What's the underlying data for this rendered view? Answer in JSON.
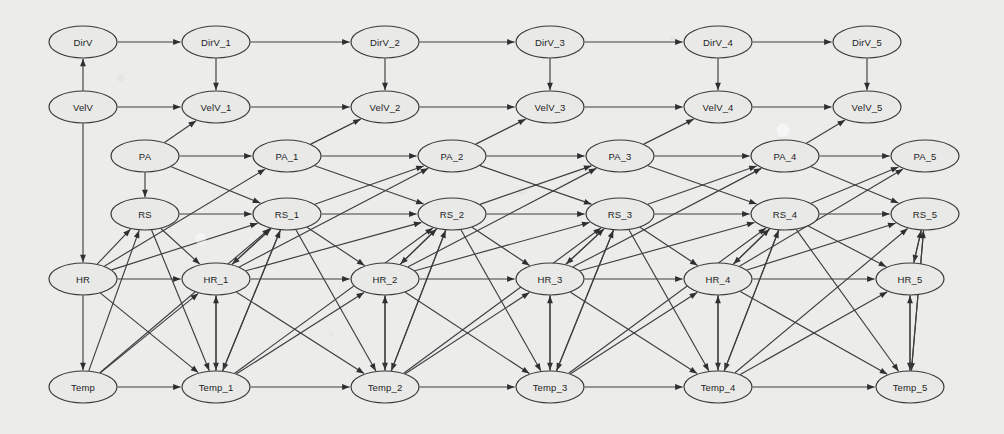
{
  "figure": {
    "kind": "dynamic-bayesian-network",
    "title": "",
    "background_color": "#ececeb",
    "node_fill": "#e9e9e8",
    "node_stroke": "#3a3a3a",
    "edge_color": "#3e3e3e",
    "node_width": 68,
    "node_height": 32
  },
  "variables": [
    "DirV",
    "VelV",
    "PA",
    "RS",
    "HR",
    "Temp"
  ],
  "rows": [
    {
      "name": "DirV",
      "y": 42
    },
    {
      "name": "VelV",
      "y": 107
    },
    {
      "name": "PA",
      "y": 156
    },
    {
      "name": "RS",
      "y": 214
    },
    {
      "name": "HR",
      "y": 279
    },
    {
      "name": "Temp",
      "y": 387
    }
  ],
  "slices": [
    {
      "index": 0,
      "suffix": "",
      "x_main": 83,
      "x_mid": 145
    },
    {
      "index": 1,
      "suffix": "_1",
      "x_main": 216,
      "x_mid": 287
    },
    {
      "index": 2,
      "suffix": "_2",
      "x_main": 385,
      "x_mid": 452
    },
    {
      "index": 3,
      "suffix": "_3",
      "x_main": 550,
      "x_mid": 620
    },
    {
      "index": 4,
      "suffix": "_4",
      "x_main": 718,
      "x_mid": 785
    },
    {
      "index": 5,
      "suffix": "_5",
      "x_main": 910,
      "x_mid": 925
    }
  ],
  "nodes": [
    {
      "id": "DirV",
      "label": "DirV",
      "x": 83,
      "y": 42
    },
    {
      "id": "VelV",
      "label": "VelV",
      "x": 83,
      "y": 107
    },
    {
      "id": "PA",
      "label": "PA",
      "x": 145,
      "y": 156
    },
    {
      "id": "RS",
      "label": "RS",
      "x": 145,
      "y": 214
    },
    {
      "id": "HR",
      "label": "HR",
      "x": 83,
      "y": 279
    },
    {
      "id": "Temp",
      "label": "Temp",
      "x": 83,
      "y": 387
    },
    {
      "id": "DirV_1",
      "label": "DirV_1",
      "x": 216,
      "y": 42
    },
    {
      "id": "VelV_1",
      "label": "VelV_1",
      "x": 216,
      "y": 107
    },
    {
      "id": "PA_1",
      "label": "PA_1",
      "x": 287,
      "y": 156
    },
    {
      "id": "RS_1",
      "label": "RS_1",
      "x": 287,
      "y": 214
    },
    {
      "id": "HR_1",
      "label": "HR_1",
      "x": 216,
      "y": 279
    },
    {
      "id": "Temp_1",
      "label": "Temp_1",
      "x": 216,
      "y": 387
    },
    {
      "id": "DirV_2",
      "label": "DirV_2",
      "x": 385,
      "y": 42
    },
    {
      "id": "VelV_2",
      "label": "VelV_2",
      "x": 385,
      "y": 107
    },
    {
      "id": "PA_2",
      "label": "PA_2",
      "x": 452,
      "y": 156
    },
    {
      "id": "RS_2",
      "label": "RS_2",
      "x": 452,
      "y": 214
    },
    {
      "id": "HR_2",
      "label": "HR_2",
      "x": 385,
      "y": 279
    },
    {
      "id": "Temp_2",
      "label": "Temp_2",
      "x": 385,
      "y": 387
    },
    {
      "id": "DirV_3",
      "label": "DirV_3",
      "x": 550,
      "y": 42
    },
    {
      "id": "VelV_3",
      "label": "VelV_3",
      "x": 550,
      "y": 107
    },
    {
      "id": "PA_3",
      "label": "PA_3",
      "x": 620,
      "y": 156
    },
    {
      "id": "RS_3",
      "label": "RS_3",
      "x": 620,
      "y": 214
    },
    {
      "id": "HR_3",
      "label": "HR_3",
      "x": 550,
      "y": 279
    },
    {
      "id": "Temp_3",
      "label": "Temp_3",
      "x": 550,
      "y": 387
    },
    {
      "id": "DirV_4",
      "label": "DirV_4",
      "x": 718,
      "y": 42
    },
    {
      "id": "VelV_4",
      "label": "VelV_4",
      "x": 718,
      "y": 107
    },
    {
      "id": "PA_4",
      "label": "PA_4",
      "x": 785,
      "y": 156
    },
    {
      "id": "RS_4",
      "label": "RS_4",
      "x": 785,
      "y": 214
    },
    {
      "id": "HR_4",
      "label": "HR_4",
      "x": 718,
      "y": 279
    },
    {
      "id": "Temp_4",
      "label": "Temp_4",
      "x": 718,
      "y": 387
    },
    {
      "id": "DirV_5",
      "label": "DirV_5",
      "x": 867,
      "y": 42
    },
    {
      "id": "VelV_5",
      "label": "VelV_5",
      "x": 867,
      "y": 107
    },
    {
      "id": "PA_5",
      "label": "PA_5",
      "x": 925,
      "y": 156
    },
    {
      "id": "RS_5",
      "label": "RS_5",
      "x": 925,
      "y": 214
    },
    {
      "id": "HR_5",
      "label": "HR_5",
      "x": 910,
      "y": 279
    },
    {
      "id": "Temp_5",
      "label": "Temp_5",
      "x": 910,
      "y": 387
    }
  ],
  "edges": [
    [
      "VelV",
      "DirV"
    ],
    [
      "VelV",
      "HR"
    ],
    [
      "PA",
      "RS"
    ],
    [
      "HR",
      "Temp"
    ],
    [
      "PA",
      "VelV_1"
    ],
    [
      "HR",
      "RS"
    ],
    [
      "Temp",
      "RS"
    ],
    [
      "DirV",
      "DirV_1"
    ],
    [
      "DirV_1",
      "VelV_1"
    ],
    [
      "VelV",
      "VelV_1"
    ],
    [
      "PA",
      "PA_1"
    ],
    [
      "PA",
      "RS_1"
    ],
    [
      "RS",
      "RS_1"
    ],
    [
      "RS",
      "HR_1"
    ],
    [
      "HR",
      "HR_1"
    ],
    [
      "HR",
      "RS_1"
    ],
    [
      "HR",
      "Temp_1"
    ],
    [
      "HR",
      "PA_1"
    ],
    [
      "Temp",
      "Temp_1"
    ],
    [
      "Temp",
      "RS_1"
    ],
    [
      "Temp",
      "HR_1"
    ],
    [
      "RS",
      "Temp_1"
    ],
    [
      "RS_1",
      "HR_1"
    ],
    [
      "RS_1",
      "Temp_1"
    ],
    [
      "HR_1",
      "Temp_1"
    ],
    [
      "HR_1",
      "RS_1"
    ],
    [
      "Temp_1",
      "RS_1"
    ],
    [
      "Temp_1",
      "HR_1"
    ],
    [
      "DirV_1",
      "DirV_2"
    ],
    [
      "DirV_2",
      "VelV_2"
    ],
    [
      "VelV_1",
      "VelV_2"
    ],
    [
      "PA_1",
      "VelV_2"
    ],
    [
      "PA_1",
      "PA_2"
    ],
    [
      "PA_1",
      "RS_2"
    ],
    [
      "RS_1",
      "RS_2"
    ],
    [
      "RS_1",
      "HR_2"
    ],
    [
      "RS_1",
      "PA_2"
    ],
    [
      "RS_1",
      "Temp_2"
    ],
    [
      "HR_1",
      "HR_2"
    ],
    [
      "HR_1",
      "RS_2"
    ],
    [
      "HR_1",
      "Temp_2"
    ],
    [
      "HR_1",
      "PA_2"
    ],
    [
      "Temp_1",
      "Temp_2"
    ],
    [
      "Temp_1",
      "RS_2"
    ],
    [
      "Temp_1",
      "HR_2"
    ],
    [
      "RS_2",
      "HR_2"
    ],
    [
      "RS_2",
      "Temp_2"
    ],
    [
      "HR_2",
      "Temp_2"
    ],
    [
      "HR_2",
      "RS_2"
    ],
    [
      "Temp_2",
      "RS_2"
    ],
    [
      "Temp_2",
      "HR_2"
    ],
    [
      "DirV_2",
      "DirV_3"
    ],
    [
      "DirV_3",
      "VelV_3"
    ],
    [
      "VelV_2",
      "VelV_3"
    ],
    [
      "PA_2",
      "VelV_3"
    ],
    [
      "PA_2",
      "PA_3"
    ],
    [
      "PA_2",
      "RS_3"
    ],
    [
      "RS_2",
      "RS_3"
    ],
    [
      "RS_2",
      "HR_3"
    ],
    [
      "RS_2",
      "PA_3"
    ],
    [
      "RS_2",
      "Temp_3"
    ],
    [
      "HR_2",
      "HR_3"
    ],
    [
      "HR_2",
      "RS_3"
    ],
    [
      "HR_2",
      "Temp_3"
    ],
    [
      "HR_2",
      "PA_3"
    ],
    [
      "Temp_2",
      "Temp_3"
    ],
    [
      "Temp_2",
      "RS_3"
    ],
    [
      "Temp_2",
      "HR_3"
    ],
    [
      "RS_3",
      "HR_3"
    ],
    [
      "RS_3",
      "Temp_3"
    ],
    [
      "HR_3",
      "Temp_3"
    ],
    [
      "HR_3",
      "RS_3"
    ],
    [
      "Temp_3",
      "RS_3"
    ],
    [
      "Temp_3",
      "HR_3"
    ],
    [
      "DirV_3",
      "DirV_4"
    ],
    [
      "DirV_4",
      "VelV_4"
    ],
    [
      "VelV_3",
      "VelV_4"
    ],
    [
      "PA_3",
      "VelV_4"
    ],
    [
      "PA_3",
      "PA_4"
    ],
    [
      "PA_3",
      "RS_4"
    ],
    [
      "RS_3",
      "RS_4"
    ],
    [
      "RS_3",
      "HR_4"
    ],
    [
      "RS_3",
      "PA_4"
    ],
    [
      "RS_3",
      "Temp_4"
    ],
    [
      "HR_3",
      "HR_4"
    ],
    [
      "HR_3",
      "RS_4"
    ],
    [
      "HR_3",
      "Temp_4"
    ],
    [
      "HR_3",
      "PA_4"
    ],
    [
      "Temp_3",
      "Temp_4"
    ],
    [
      "Temp_3",
      "RS_4"
    ],
    [
      "Temp_3",
      "HR_4"
    ],
    [
      "RS_4",
      "HR_4"
    ],
    [
      "RS_4",
      "Temp_4"
    ],
    [
      "HR_4",
      "Temp_4"
    ],
    [
      "HR_4",
      "RS_4"
    ],
    [
      "Temp_4",
      "RS_4"
    ],
    [
      "Temp_4",
      "HR_4"
    ],
    [
      "DirV_4",
      "DirV_5"
    ],
    [
      "DirV_5",
      "VelV_5"
    ],
    [
      "VelV_4",
      "VelV_5"
    ],
    [
      "PA_4",
      "VelV_5"
    ],
    [
      "PA_4",
      "PA_5"
    ],
    [
      "PA_4",
      "RS_5"
    ],
    [
      "RS_4",
      "RS_5"
    ],
    [
      "RS_4",
      "HR_5"
    ],
    [
      "RS_4",
      "PA_5"
    ],
    [
      "RS_4",
      "Temp_5"
    ],
    [
      "HR_4",
      "HR_5"
    ],
    [
      "HR_4",
      "RS_5"
    ],
    [
      "HR_4",
      "Temp_5"
    ],
    [
      "HR_4",
      "PA_5"
    ],
    [
      "Temp_4",
      "Temp_5"
    ],
    [
      "Temp_4",
      "RS_5"
    ],
    [
      "Temp_4",
      "HR_5"
    ],
    [
      "RS_5",
      "HR_5"
    ],
    [
      "RS_5",
      "Temp_5"
    ],
    [
      "HR_5",
      "Temp_5"
    ],
    [
      "HR_5",
      "RS_5"
    ],
    [
      "Temp_5",
      "RS_5"
    ],
    [
      "Temp_5",
      "HR_5"
    ]
  ]
}
